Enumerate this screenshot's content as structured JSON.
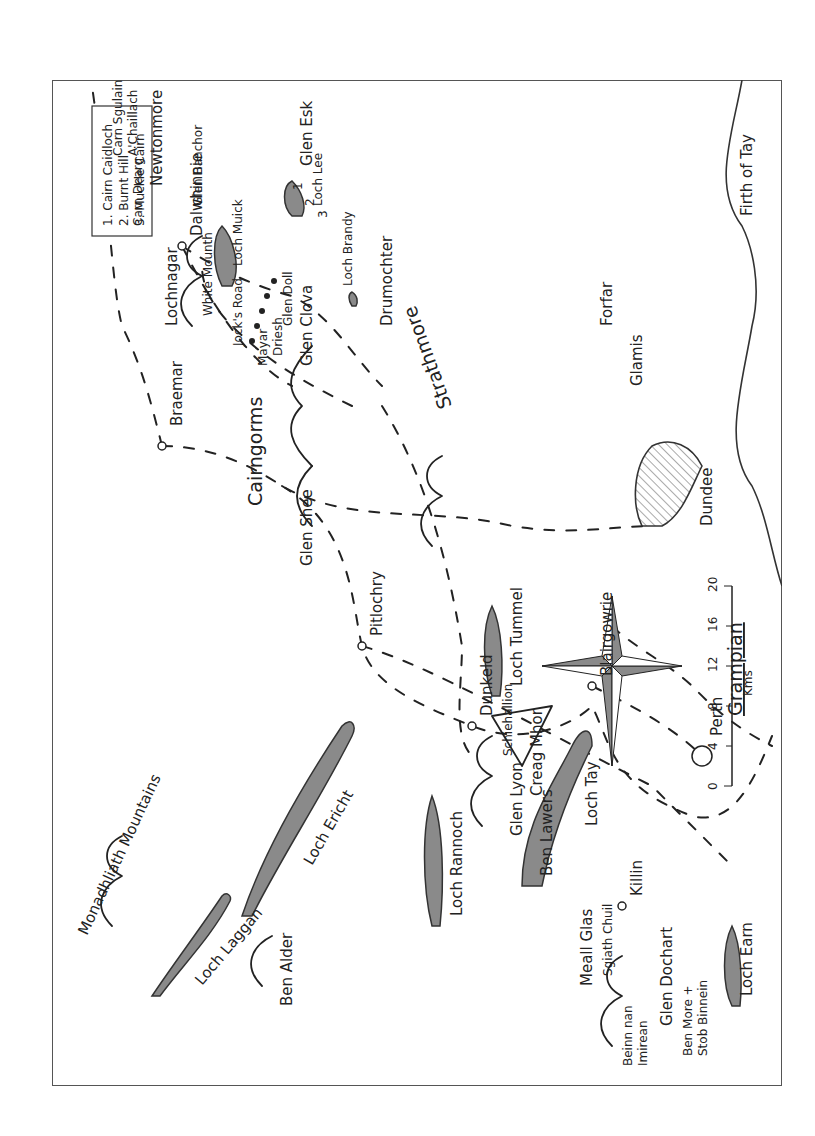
{
  "map": {
    "title": "Grampian",
    "orientation": "rotated 90° counter-clockwise",
    "legend": {
      "items": [
        "1. Cairn Caidloch",
        "2. Burnt Hill",
        "3. Muckle Cairn"
      ]
    },
    "scale": {
      "ticks": [
        "0",
        "4",
        "8",
        "12",
        "16",
        "20"
      ],
      "unit": "Kms"
    },
    "compass": "compass-rose",
    "regions": {
      "strathmore": "Strathmore",
      "mountains": "Monadhliath Mountains",
      "cairngorms": "Cairngorms"
    },
    "towns": {
      "braemar": "Braemar",
      "pitlochry": "Pitlochry",
      "dunkeld": "Dunkeld",
      "perth": "Perth",
      "blairgowrie": "Blairgowrie",
      "dundee": "Dundee",
      "forfar": "Forfar",
      "glamis": "Glamis",
      "dalwhinnie": "Dalwhinnie",
      "newtonmore": "Newtonmore",
      "killin": "Killin",
      "drumochter": "Drumochter"
    },
    "glens": {
      "shee": "Glen Shee",
      "clova": "Glen Clova",
      "doll": "Glen Doll",
      "esk": "Glen Esk",
      "lyon": "Glen Lyon",
      "dochart": "Glen Dochart",
      "banchor": "Glen Banchor"
    },
    "lochs": {
      "muick": "Loch Muick",
      "lee": "Loch Lee",
      "brandy": "Loch Brandy",
      "tummel": "Loch Tummel",
      "rannoch": "Loch Rannoch",
      "tay": "Loch Tay",
      "earn": "Loch Earn",
      "ericht": "Loch Ericht",
      "laggan": "Loch Laggan"
    },
    "firth": "Firth of Tay",
    "mountains": {
      "lochnagar": "Lochnagar",
      "white_mounth": "White Mounth",
      "jocks_road": "Jock's Road",
      "mayar": "Mayar",
      "driesh": "Driesh",
      "schiehallion": "Schiehallion",
      "creag_mhor": "Creag Mhor",
      "ben_lawers": "Ben Lawers",
      "meall_glas": "Meall Glas",
      "sgiath_chuil": "Sgiath Chuil",
      "beinn_nan_imirean_1": "Beinn nan",
      "beinn_nan_imirean_2": "Imirean",
      "ben_more_1": "Ben More +",
      "ben_more_2": "Stob Binnein",
      "ben_alder": "Ben Alder",
      "carn_dearg": "Carn Dearg",
      "carn_sgulain": "Carn Sgulain",
      "chaillach": "A'Chaillach",
      "mtn_num_1": "1",
      "mtn_num_2": "2",
      "mtn_num_3": "3"
    },
    "colors": {
      "water": "#8a8a8a",
      "ink": "#222222",
      "border": "#555555"
    }
  }
}
